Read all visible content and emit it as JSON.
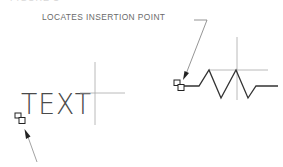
{
  "figure": {
    "title_cut": "FIGURE 1",
    "callout_label": "LOCATES INSERTION POINT",
    "sample_text": "TEXT",
    "examples": [
      {
        "name": "text-object",
        "marker": "insertion-point-grip",
        "content": "TEXT"
      },
      {
        "name": "symbol-object",
        "marker": "insertion-point-grip",
        "content": "zigzag-break-symbol"
      }
    ],
    "colors": {
      "stroke": "#333333",
      "guide": "#9a9a9a",
      "leader": "#7a7a7a",
      "text": "#5a5a5a",
      "background": "#ffffff"
    }
  }
}
